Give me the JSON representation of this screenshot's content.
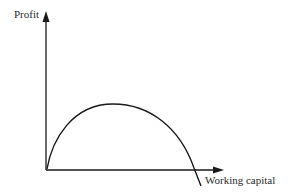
{
  "diagram": {
    "y_axis_label": "Profit",
    "x_axis_label": "Working capital",
    "curve_description": "Inverted-U profit curve vs working capital, rising from origin to a peak then falling below zero",
    "colors": {
      "line": "#1a1a1a",
      "background": "#ffffff"
    }
  }
}
